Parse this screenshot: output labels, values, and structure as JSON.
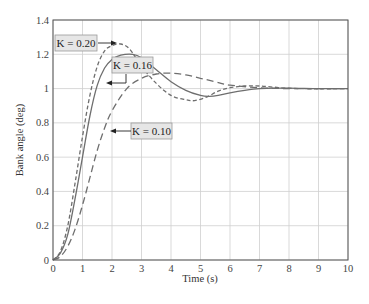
{
  "chart_data": {
    "type": "line",
    "title": "",
    "xlabel": "Time (s)",
    "ylabel": "Bank angle (deg)",
    "xlim": [
      0,
      10
    ],
    "ylim": [
      0,
      1.4
    ],
    "xticks": [
      "0",
      "1",
      "2",
      "3",
      "4",
      "5",
      "6",
      "7",
      "8",
      "9",
      "10"
    ],
    "yticks": [
      "0",
      "0.2",
      "0.4",
      "0.6",
      "0.8",
      "1",
      "1.2",
      "1.4"
    ],
    "grid": true,
    "legend": "inline annotations with arrows",
    "series": [
      {
        "name": "K = 0.20",
        "style": "short-dash",
        "x": [
          0,
          0.25,
          0.5,
          0.75,
          1.0,
          1.25,
          1.5,
          1.75,
          2.0,
          2.3,
          2.6,
          3.0,
          3.5,
          4.0,
          4.5,
          4.8,
          5.2,
          5.6,
          6.0,
          6.5,
          7.0,
          7.5,
          8.0,
          9.0,
          10.0
        ],
        "y": [
          0,
          0.05,
          0.2,
          0.45,
          0.72,
          0.96,
          1.13,
          1.22,
          1.25,
          1.26,
          1.23,
          1.13,
          1.03,
          0.96,
          0.935,
          0.93,
          0.95,
          0.985,
          1.005,
          1.015,
          1.015,
          1.008,
          1.002,
          0.998,
          1.0
        ]
      },
      {
        "name": "K = 0.16",
        "style": "solid",
        "x": [
          0,
          0.25,
          0.5,
          0.75,
          1.0,
          1.25,
          1.5,
          1.75,
          2.0,
          2.3,
          2.7,
          3.0,
          3.5,
          4.0,
          4.5,
          5.0,
          5.3,
          5.6,
          6.0,
          6.5,
          7.0,
          7.5,
          8.0,
          9.0,
          10.0
        ],
        "y": [
          0,
          0.04,
          0.15,
          0.36,
          0.6,
          0.84,
          1.02,
          1.12,
          1.17,
          1.195,
          1.2,
          1.18,
          1.11,
          1.04,
          0.99,
          0.96,
          0.955,
          0.96,
          0.975,
          0.99,
          1.0,
          1.003,
          1.003,
          1.0,
          1.0
        ]
      },
      {
        "name": "K = 0.10",
        "style": "long-dash",
        "x": [
          0,
          0.25,
          0.5,
          0.75,
          1.0,
          1.25,
          1.5,
          1.75,
          2.0,
          2.5,
          3.0,
          3.5,
          4.0,
          4.5,
          5.0,
          5.5,
          6.0,
          7.0,
          8.0,
          9.0,
          10.0
        ],
        "y": [
          0,
          0.02,
          0.08,
          0.18,
          0.32,
          0.48,
          0.64,
          0.77,
          0.87,
          1.0,
          1.06,
          1.085,
          1.09,
          1.08,
          1.06,
          1.04,
          1.02,
          1.005,
          1.0,
          1.0,
          1.0
        ]
      }
    ],
    "annotations": [
      {
        "text": "K = 0.20",
        "arrow_to": [
          2.2,
          1.26
        ]
      },
      {
        "text": "K = 0.16",
        "arrow_to": [
          1.7,
          1.03
        ]
      },
      {
        "text": "K = 0.10",
        "arrow_to": [
          1.85,
          0.8
        ]
      }
    ]
  },
  "labels": {
    "xlabel": "Time (s)",
    "ylabel": "Bank angle (deg)",
    "k020": "K = 0.20",
    "k016": "K = 0.16",
    "k010": "K = 0.10"
  }
}
